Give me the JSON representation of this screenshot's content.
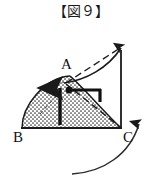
{
  "figure": {
    "title": "【図９】",
    "title_icon": "figure-number-bracket",
    "number": "9"
  },
  "diagram": {
    "type": "geometry-physics-figure",
    "vertices": [
      {
        "id": "A",
        "label": "A",
        "x": 70,
        "y": 76
      },
      {
        "id": "B",
        "label": "B",
        "x": 22,
        "y": 128
      },
      {
        "id": "C",
        "label": "C",
        "x": 121,
        "y": 128
      }
    ],
    "colors": {
      "stroke": "#1a1a1a",
      "fill_dots": "#2b2b2b",
      "background": "#ffffff"
    },
    "elements": {
      "shaded_region": "stippled-curved-region",
      "up_arrow": "vertical-up-arrow",
      "right_angle_marker": "right-angle-bracket-with-dot",
      "dashed_chord": "dashed-line-A-to-apex",
      "dashed_chord_2": "dashed-line-A-to-C",
      "solid_curve": "solid-curve-A-to-apex",
      "vertical_axis": "vertical-line-C-to-apex",
      "rotation_arrow": "curved-rotation-arrow"
    }
  }
}
